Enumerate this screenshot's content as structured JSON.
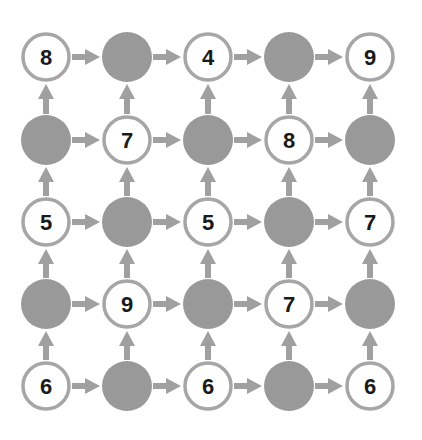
{
  "grid": {
    "rows": 5,
    "cols": 5,
    "col_x": [
      46,
      127,
      208,
      289,
      370
    ],
    "row_y": [
      57,
      140,
      222,
      304,
      386
    ],
    "radius": 24,
    "cells": [
      [
        "8",
        null,
        "4",
        null,
        "9"
      ],
      [
        null,
        "7",
        null,
        "8",
        null
      ],
      [
        "5",
        null,
        "5",
        null,
        "7"
      ],
      [
        null,
        "9",
        null,
        "7",
        null
      ],
      [
        "6",
        null,
        "6",
        null,
        "6"
      ]
    ]
  },
  "arrows": "right-and-up",
  "colors": {
    "filled": "#999999",
    "stroke": "#a6a6a6",
    "arrow": "#a0a0a0",
    "text": "#1a1a1a"
  }
}
